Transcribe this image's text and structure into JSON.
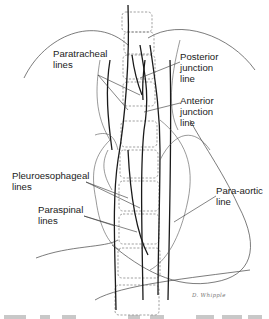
{
  "figure": {
    "colors": {
      "line": "#1a1a1a",
      "thin_line": "#555555",
      "dashed": "#7a7a7a",
      "text": "#222222",
      "background": "#ffffff"
    },
    "labels": [
      {
        "id": "paratracheal",
        "lines": [
          "Paratracheal",
          "lines"
        ],
        "x": 53,
        "y": 48,
        "leaders": [
          [
            98,
            75,
            140,
            95
          ],
          [
            98,
            75,
            128,
            110
          ]
        ]
      },
      {
        "id": "posterior-junction",
        "lines": [
          "Posterior",
          "junction",
          "line"
        ],
        "x": 180,
        "y": 51,
        "leaders": [
          [
            180,
            62,
            140,
            78
          ]
        ]
      },
      {
        "id": "anterior-junction",
        "lines": [
          "Anterior",
          "junction",
          "line"
        ],
        "x": 180,
        "y": 95,
        "leaders": [
          [
            180,
            103,
            144,
            112
          ]
        ]
      },
      {
        "id": "pleuroesophageal",
        "lines": [
          "Pleuroesophageal",
          "lines"
        ],
        "x": 12,
        "y": 170,
        "leaders": [
          [
            86,
            182,
            128,
            198
          ],
          [
            86,
            182,
            140,
            208
          ]
        ]
      },
      {
        "id": "paraspinal",
        "lines": [
          "Paraspinal",
          "lines"
        ],
        "x": 38,
        "y": 204,
        "leaders": [
          [
            84,
            216,
            115,
            226
          ],
          [
            84,
            216,
            137,
            232
          ]
        ]
      },
      {
        "id": "para-aortic",
        "lines": [
          "Para-aortic",
          "line"
        ],
        "x": 216,
        "y": 185,
        "leaders": [
          [
            216,
            196,
            174,
            222
          ]
        ]
      }
    ],
    "signature": "D. Whipple",
    "caption_note": "caption text below figure is cropped and illegible"
  }
}
